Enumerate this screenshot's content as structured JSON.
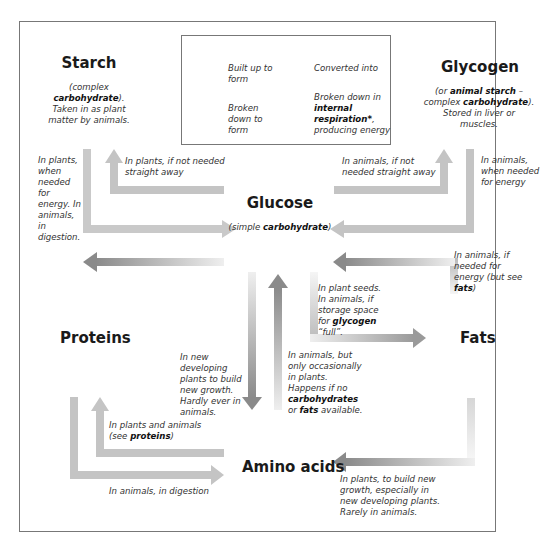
{
  "legend": {
    "built_up": "Built up to form",
    "converted": "Converted into",
    "broken_down": "Broken down to form",
    "respiration_pre": "Broken down in ",
    "respiration_bold": "internal respiration*",
    "respiration_post": ", producing energy",
    "colors": {
      "built_up": "#c8c8c8",
      "converted": "#bdbdbd",
      "broken_down": "#b8b8b8",
      "respiration": "#8f8f8f"
    }
  },
  "nodes": {
    "starch": {
      "title": "Starch",
      "desc_pre": "(complex ",
      "desc_bold": "carbohydrate",
      "desc_post": "). Taken in as plant matter by animals."
    },
    "glycogen": {
      "title": "Glycogen",
      "desc_pre": "(or ",
      "desc_bold1": "animal starch",
      "desc_mid": " – complex ",
      "desc_bold2": "carbohydrate",
      "desc_post": "). Stored in liver or muscles."
    },
    "glucose": {
      "title": "Glucose",
      "desc_pre": "(simple ",
      "desc_bold": "carbohydrate",
      "desc_post": ")"
    },
    "proteins": {
      "title": "Proteins"
    },
    "fats": {
      "title": "Fats"
    },
    "amino_acids": {
      "title": "Amino acids"
    }
  },
  "labels": {
    "starch_to_glucose": "In plants, when needed for energy. In animals, in digestion.",
    "glucose_to_starch": "In plants, if not needed straight away",
    "glucose_to_glycogen": "In animals, if not needed straight away",
    "glycogen_to_glucose": "In animals, when needed for energy",
    "fats_to_glucose_pre": "In animals, if needed for energy (but see ",
    "fats_to_glucose_bold": "fats",
    "fats_to_glucose_post": ")",
    "glucose_to_fats_pre": "In plant seeds. In animals, if storage space for ",
    "glucose_to_fats_bold": "glycogen",
    "glucose_to_fats_post": " “full”.",
    "glucose_to_amino": "In new developing plants to build new growth. Hardly ever in animals.",
    "amino_to_glucose_pre": "In animals, but only occasionally in plants. Happens if no ",
    "amino_to_glucose_bold1": "carbohydrates",
    "amino_to_glucose_mid": " or ",
    "amino_to_glucose_bold2": "fats",
    "amino_to_glucose_post": " available.",
    "amino_to_proteins_pre": "In plants and animals (see ",
    "amino_to_proteins_bold": "proteins",
    "amino_to_proteins_post": ")",
    "proteins_to_amino": "In animals, in digestion",
    "fats_to_amino": "In plants, to build new growth, especially in new developing plants. Rarely in animals."
  }
}
